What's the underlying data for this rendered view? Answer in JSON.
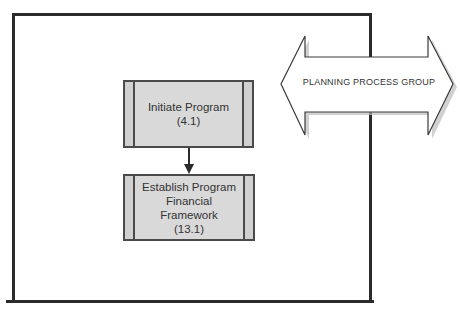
{
  "diagram": {
    "type": "process-flow",
    "process_group_band": {
      "label": "PLANNING PROCESS GROUP",
      "shape": "double-headed-arrow"
    },
    "processes": [
      {
        "id": "p1",
        "label": "Initiate Program\n(4.1)",
        "name": "Initiate Program",
        "ref": "4.1"
      },
      {
        "id": "p2",
        "label": "Establish Program\nFinancial Framework\n(13.1)",
        "name": "Establish Program Financial Framework",
        "ref": "13.1"
      }
    ],
    "connections": [
      {
        "from": "p1",
        "to": "p2"
      }
    ],
    "colors": {
      "box_fill": "#d9d9d9",
      "stroke": "#2b2b2b",
      "text": "#333333",
      "arrow_shadow": "#b0b0b0"
    }
  }
}
